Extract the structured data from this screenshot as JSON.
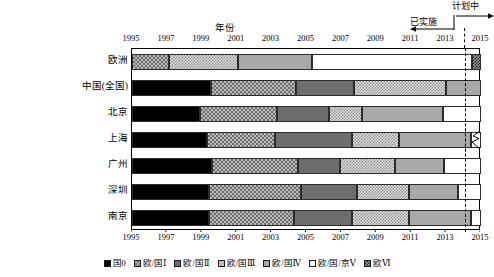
{
  "chart_data": {
    "type": "bar",
    "orientation": "horizontal",
    "subtype": "stacked-timeline",
    "title": "",
    "xlabel": "年份",
    "ylabel": "",
    "xlim": [
      1995,
      2015
    ],
    "xtick_step": 2,
    "xticks": [
      "1995",
      "1997",
      "1999",
      "2001",
      "2003",
      "2005",
      "2007",
      "2009",
      "2011",
      "2013",
      "2015"
    ],
    "grid": false,
    "legend_position": "bottom",
    "categories": [
      "欧洲",
      "中国(全国)",
      "北京",
      "上海",
      "广州",
      "深圳",
      "南京"
    ],
    "series": [
      {
        "name": "国0",
        "key": "guo0"
      },
      {
        "name": "欧/国Ⅰ",
        "key": "ou1"
      },
      {
        "name": "欧/国Ⅱ",
        "key": "ou2"
      },
      {
        "name": "欧/国Ⅲ",
        "key": "ou3"
      },
      {
        "name": "欧/国Ⅳ",
        "key": "ou4"
      },
      {
        "name": "欧/国/京Ⅴ",
        "key": "ou5"
      },
      {
        "name": "欧Ⅵ",
        "key": "ou6"
      }
    ],
    "rows": [
      {
        "label": "欧洲",
        "broken_axis": false,
        "spans": [
          {
            "key": "ou1",
            "start": 1995.0,
            "end": 1997.1
          },
          {
            "key": "ou3",
            "start": 1997.1,
            "end": 2001.1
          },
          {
            "key": "ou4",
            "start": 2001.1,
            "end": 2005.3
          },
          {
            "key": "ou5",
            "start": 2005.3,
            "end": 2014.5
          },
          {
            "key": "ou6",
            "start": 2014.5,
            "end": 2015.0
          }
        ]
      },
      {
        "label": "中国(全国)",
        "broken_axis": false,
        "spans": [
          {
            "key": "guo0",
            "start": 1995.0,
            "end": 1999.5
          },
          {
            "key": "ou1",
            "start": 1999.5,
            "end": 2004.4
          },
          {
            "key": "ou2",
            "start": 2004.4,
            "end": 2007.7
          },
          {
            "key": "ou3",
            "start": 2007.7,
            "end": 2013.0
          },
          {
            "key": "ou4",
            "start": 2013.0,
            "end": 2015.0
          }
        ]
      },
      {
        "label": "北京",
        "broken_axis": false,
        "spans": [
          {
            "key": "guo0",
            "start": 1995.0,
            "end": 1998.9
          },
          {
            "key": "ou1",
            "start": 1998.9,
            "end": 2003.3
          },
          {
            "key": "ou2",
            "start": 2003.3,
            "end": 2006.3
          },
          {
            "key": "ou3",
            "start": 2006.3,
            "end": 2008.2
          },
          {
            "key": "ou4",
            "start": 2008.2,
            "end": 2012.8
          },
          {
            "key": "ou5",
            "start": 2012.8,
            "end": 2015.0
          }
        ]
      },
      {
        "label": "上海",
        "broken_axis": true,
        "spans": [
          {
            "key": "guo0",
            "start": 1995.0,
            "end": 1999.3
          },
          {
            "key": "ou1",
            "start": 1999.3,
            "end": 2003.2
          },
          {
            "key": "ou2",
            "start": 2003.2,
            "end": 2007.6
          },
          {
            "key": "ou3",
            "start": 2007.6,
            "end": 2010.3
          },
          {
            "key": "ou4",
            "start": 2010.3,
            "end": 2014.4
          },
          {
            "key": "ou5",
            "start": 2014.4,
            "end": 2015.0
          }
        ]
      },
      {
        "label": "广州",
        "broken_axis": false,
        "spans": [
          {
            "key": "guo0",
            "start": 1995.0,
            "end": 1999.6
          },
          {
            "key": "ou1",
            "start": 1999.6,
            "end": 2004.5
          },
          {
            "key": "ou2",
            "start": 2004.5,
            "end": 2006.9
          },
          {
            "key": "ou3",
            "start": 2006.9,
            "end": 2010.1
          },
          {
            "key": "ou4",
            "start": 2010.1,
            "end": 2012.9
          },
          {
            "key": "ou5",
            "start": 2012.9,
            "end": 2015.0
          }
        ]
      },
      {
        "label": "深圳",
        "broken_axis": false,
        "spans": [
          {
            "key": "guo0",
            "start": 1995.0,
            "end": 1999.4
          },
          {
            "key": "ou1",
            "start": 1999.4,
            "end": 2004.7
          },
          {
            "key": "ou2",
            "start": 2004.7,
            "end": 2007.9
          },
          {
            "key": "ou3",
            "start": 2007.9,
            "end": 2010.9
          },
          {
            "key": "ou4",
            "start": 2010.9,
            "end": 2013.7
          },
          {
            "key": "ou5",
            "start": 2013.7,
            "end": 2015.0
          }
        ]
      },
      {
        "label": "南京",
        "broken_axis": false,
        "spans": [
          {
            "key": "guo0",
            "start": 1995.0,
            "end": 1999.4
          },
          {
            "key": "ou1",
            "start": 1999.4,
            "end": 2004.3
          },
          {
            "key": "ou2",
            "start": 2004.3,
            "end": 2007.6
          },
          {
            "key": "ou3",
            "start": 2007.6,
            "end": 2010.9
          },
          {
            "key": "ou4",
            "start": 2010.9,
            "end": 2014.4
          },
          {
            "key": "ou5",
            "start": 2014.4,
            "end": 2015.0
          }
        ]
      }
    ],
    "annotations": [
      {
        "name": "implemented",
        "text": "已实施",
        "year_boundary": 2014.1,
        "direction": "left"
      },
      {
        "name": "planned",
        "text": "计划中",
        "year_boundary": 2014.1,
        "direction": "right"
      }
    ],
    "divider_year": 2014.1
  },
  "colors": {
    "guo0": "#000000",
    "ou1": "#b9b9b9",
    "ou2": "#6d6d6d",
    "ou3": "#dadada",
    "ou4": "#a8a8a8",
    "ou5": "#ffffff",
    "ou6": "#9a9a9a",
    "axis": "#000000",
    "background": "#ffffff"
  }
}
